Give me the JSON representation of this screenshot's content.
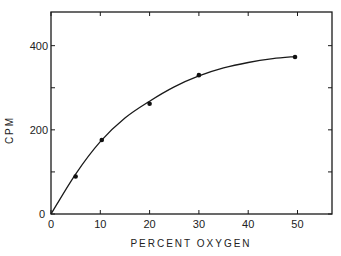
{
  "chart_data": {
    "type": "scatter",
    "title": "",
    "xlabel": "PERCENT OXYGEN",
    "ylabel": "CPM",
    "xlim": [
      0,
      57
    ],
    "ylim": [
      0,
      480
    ],
    "grid": false,
    "x_ticks": [
      0,
      10,
      20,
      30,
      40,
      50
    ],
    "y_ticks": [
      0,
      200,
      400
    ],
    "y_minor_ticks": [
      100,
      300
    ],
    "series": [
      {
        "name": "data",
        "points": [
          {
            "x": 5,
            "y": 89
          },
          {
            "x": 10.3,
            "y": 176
          },
          {
            "x": 20,
            "y": 262
          },
          {
            "x": 30,
            "y": 330
          },
          {
            "x": 49.5,
            "y": 373
          }
        ]
      },
      {
        "name": "fitted curve",
        "style": "line",
        "points": [
          {
            "x": 0,
            "y": 0
          },
          {
            "x": 5,
            "y": 95
          },
          {
            "x": 10,
            "y": 172
          },
          {
            "x": 15,
            "y": 228
          },
          {
            "x": 20,
            "y": 268
          },
          {
            "x": 25,
            "y": 302
          },
          {
            "x": 30,
            "y": 328
          },
          {
            "x": 35,
            "y": 347
          },
          {
            "x": 40,
            "y": 360
          },
          {
            "x": 45,
            "y": 369
          },
          {
            "x": 49.5,
            "y": 374
          }
        ]
      }
    ]
  }
}
